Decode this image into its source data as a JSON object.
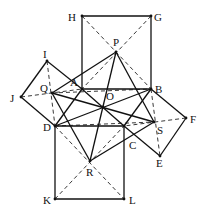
{
  "diagram": {
    "title": "",
    "points": {
      "H": {
        "label": "H",
        "x": 82,
        "y": 16,
        "lx": 68,
        "ly": 21
      },
      "G": {
        "label": "G",
        "x": 151,
        "y": 16,
        "lx": 154,
        "ly": 21
      },
      "P": {
        "label": "P",
        "x": 116,
        "y": 52,
        "lx": 113,
        "ly": 46
      },
      "A": {
        "label": "A",
        "x": 82,
        "y": 89,
        "lx": 70,
        "ly": 86
      },
      "B": {
        "label": "B",
        "x": 151,
        "y": 89,
        "lx": 155,
        "ly": 93
      },
      "I": {
        "label": "I",
        "x": 47,
        "y": 61,
        "lx": 43,
        "ly": 58
      },
      "J": {
        "label": "J",
        "x": 21,
        "y": 97,
        "lx": 10,
        "ly": 102
      },
      "Q": {
        "label": "Q",
        "x": 52,
        "y": 93,
        "lx": 40,
        "ly": 92
      },
      "O": {
        "label": "O",
        "x": 103,
        "y": 107,
        "lx": 106,
        "ly": 100
      },
      "D": {
        "label": "D",
        "x": 55,
        "y": 126,
        "lx": 43,
        "ly": 131
      },
      "C": {
        "label": "C",
        "x": 124,
        "y": 126,
        "lx": 129,
        "ly": 149
      },
      "S": {
        "label": "S",
        "x": 154,
        "y": 122,
        "lx": 157,
        "ly": 134
      },
      "F": {
        "label": "F",
        "x": 186,
        "y": 118,
        "lx": 190,
        "ly": 123
      },
      "E": {
        "label": "E",
        "x": 160,
        "y": 156,
        "lx": 156,
        "ly": 167
      },
      "R": {
        "label": "R",
        "x": 90,
        "y": 161,
        "lx": 86,
        "ly": 176
      },
      "K": {
        "label": "K",
        "x": 55,
        "y": 199,
        "lx": 43,
        "ly": 204
      },
      "L": {
        "label": "L",
        "x": 124,
        "y": 199,
        "lx": 129,
        "ly": 204
      }
    },
    "solid_segments": [
      [
        "H",
        "G"
      ],
      [
        "G",
        "B"
      ],
      [
        "A",
        "H"
      ],
      [
        "A",
        "B"
      ],
      [
        "B",
        "C"
      ],
      [
        "C",
        "D"
      ],
      [
        "D",
        "A"
      ],
      [
        "A",
        "I"
      ],
      [
        "I",
        "J"
      ],
      [
        "J",
        "D"
      ],
      [
        "B",
        "F"
      ],
      [
        "F",
        "E"
      ],
      [
        "E",
        "C"
      ],
      [
        "D",
        "K"
      ],
      [
        "K",
        "L"
      ],
      [
        "L",
        "C"
      ],
      [
        "P",
        "Q"
      ],
      [
        "Q",
        "R"
      ],
      [
        "R",
        "S"
      ],
      [
        "S",
        "P"
      ],
      [
        "P",
        "R"
      ],
      [
        "Q",
        "S"
      ],
      [
        "A",
        "C"
      ],
      [
        "B",
        "D"
      ]
    ],
    "dashed_segments": [
      [
        "H",
        "B"
      ],
      [
        "G",
        "A"
      ],
      [
        "I",
        "D"
      ],
      [
        "J",
        "A"
      ],
      [
        "B",
        "E"
      ],
      [
        "F",
        "C"
      ],
      [
        "D",
        "L"
      ],
      [
        "K",
        "C"
      ],
      [
        "Q",
        "B"
      ],
      [
        "D",
        "S"
      ]
    ],
    "figure_description": "Quadrilateral ABCD with squares erected on each side; P, Q, R, S are the square centers; PR and QS meet at O"
  }
}
